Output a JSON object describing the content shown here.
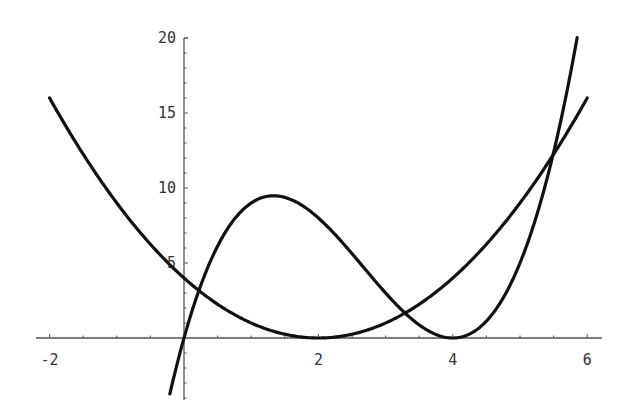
{
  "chart_data": {
    "type": "line",
    "title": "",
    "xlabel": "",
    "ylabel": "",
    "xlim": [
      -2.0,
      6.0
    ],
    "ylim": [
      -4.0,
      20.0
    ],
    "grid": false,
    "legend": null,
    "x_ticks": [
      -2,
      2,
      4,
      6
    ],
    "x_tick_labels": [
      "-2",
      "2",
      "4",
      "6"
    ],
    "y_ticks": [
      5,
      10,
      15,
      20
    ],
    "y_tick_labels": [
      "5",
      "10",
      "15",
      "20"
    ],
    "series": [
      {
        "name": "(x-2)^2",
        "expression": "(x-2)^2",
        "domain": [
          -2.0,
          6.0
        ],
        "x": [
          -2,
          -1,
          0,
          1,
          2,
          3,
          4,
          5,
          6
        ],
        "values": [
          16,
          9,
          4,
          1,
          0,
          1,
          4,
          9,
          16
        ]
      },
      {
        "name": "x(x-4)^2",
        "expression": "x*(x-4)^2",
        "domain": [
          -0.21,
          5.85
        ],
        "x": [
          -0.2,
          0,
          1,
          1.33,
          2,
          3,
          4,
          5,
          5.85
        ],
        "values": [
          -3.5,
          0,
          9,
          9.48,
          8,
          3,
          0,
          5,
          20
        ]
      }
    ],
    "annotations": []
  },
  "colors": {
    "curve": "#111111",
    "axis": "#555555",
    "background": "#ffffff"
  }
}
